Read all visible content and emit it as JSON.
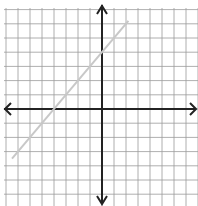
{
  "chart_data": {
    "type": "line",
    "title": "",
    "xlabel": "",
    "ylabel": "",
    "xlim": [
      -8,
      8
    ],
    "ylim": [
      -7,
      7
    ],
    "grid": true,
    "axes_arrows": true,
    "series": [
      {
        "name": "line",
        "equation": "y = x + 4",
        "slope": 1,
        "y_intercept": 4,
        "x_intercept": -4,
        "color": "#c8c8c8",
        "x": [
          -7.5,
          2.2
        ],
        "y": [
          -3.5,
          6.2
        ]
      }
    ]
  },
  "colors": {
    "grid": "#9a9a9a",
    "axis": "#222222",
    "line": "#c8c8c8",
    "background": "#ffffff"
  }
}
